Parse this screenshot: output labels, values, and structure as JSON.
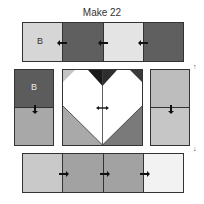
{
  "title": "Make 22",
  "top_row": {
    "segments": [
      {
        "label": "B",
        "color": "#d6d6d6"
      },
      {
        "label": "",
        "color": "#5f5f5f"
      },
      {
        "label": "",
        "color": "#e4e4e4"
      },
      {
        "label": "",
        "color": "#5f5f5f"
      }
    ],
    "press_direction": "left"
  },
  "left_column": {
    "segments": [
      {
        "label": "B",
        "color": "#5c5c5c"
      },
      {
        "label": "",
        "color": "#a8a8a8"
      }
    ],
    "press_direction": "down"
  },
  "heart_block": {
    "background": "#ffffff",
    "top_left_corner": "#c4c4c4",
    "top_center_left": "#1a1a1a",
    "top_center_right": "#2e2e2e",
    "top_right_corner": "#3a3a3a",
    "bottom_left": "#a9a9a9",
    "bottom_right": "#7a7a7a",
    "press_direction": "both"
  },
  "right_column": {
    "segments": [
      {
        "label": "",
        "color": "#bdbdbd"
      },
      {
        "label": "",
        "color": "#c6c6c6"
      }
    ],
    "press_direction": "down",
    "orientation_marks": [
      "↑",
      "↓"
    ]
  },
  "bottom_row": {
    "segments": [
      {
        "label": "",
        "color": "#c9c9c9"
      },
      {
        "label": "",
        "color": "#a2a2a2"
      },
      {
        "label": "",
        "color": "#a2a2a2"
      },
      {
        "label": "",
        "color": "#f2f2f2"
      }
    ],
    "press_direction": "right"
  }
}
